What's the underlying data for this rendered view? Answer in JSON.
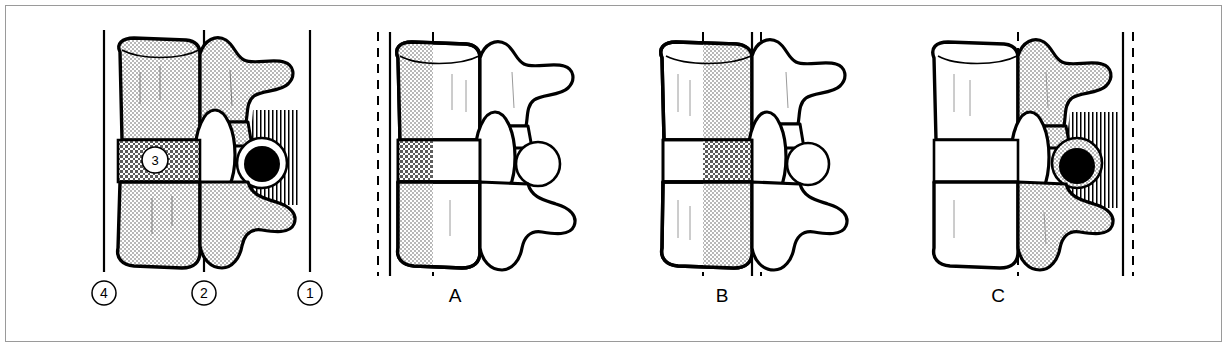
{
  "figure": {
    "panel_count": 4,
    "frame_border_color": "#9a9a9a",
    "background_color": "#ffffff",
    "ink_color": "#000000",
    "stipple_fill_color": "#d2d2d2",
    "crosshatch_fill_color": "#8a8a8a",
    "vertical_hatch_color": "#000000",
    "cord_fill_color": "#000000"
  },
  "panels": [
    {
      "id": "reference",
      "letter": "",
      "letter_x": 0,
      "letter_y": 0,
      "description": "Normal alignment key panel with four numbered reference lines",
      "shading": "whole-vertebra-stippled",
      "cord_visible": true,
      "disc_label": "3",
      "disc_label_x": 155,
      "disc_label_y": 163,
      "lines": [
        {
          "name": "line-4",
          "x": 104,
          "style": "solid",
          "label": "4",
          "label_x": 104,
          "label_y": 297
        },
        {
          "name": "line-2",
          "x": 204,
          "style": "solid",
          "label": "2",
          "label_x": 204,
          "label_y": 297
        },
        {
          "name": "line-1",
          "x": 310,
          "style": "solid",
          "label": "1",
          "label_x": 310,
          "label_y": 297
        }
      ]
    },
    {
      "id": "panel-a",
      "letter": "A",
      "letter_x": 455,
      "letter_y": 300,
      "description": "Anterior vertebral body displacement; body shaded, posterior elements clear",
      "shading": "anterior-body-stippled",
      "cord_visible": false,
      "lines": [
        {
          "name": "line-dashed-anterior",
          "x": 378,
          "style": "dashed"
        },
        {
          "name": "line-solid-anterior",
          "x": 390,
          "style": "solid"
        },
        {
          "name": "line-dashed-mid",
          "x": 433,
          "style": "dashed"
        }
      ]
    },
    {
      "id": "panel-b",
      "letter": "B",
      "letter_x": 722,
      "letter_y": 300,
      "description": "Posterior body margin displacement; posterior half of body shaded",
      "shading": "posterior-body-stippled",
      "cord_visible": false,
      "lines": [
        {
          "name": "line-dashed-anterior",
          "x": 703,
          "style": "dashed"
        },
        {
          "name": "line-solid-posterior",
          "x": 752,
          "style": "solid"
        },
        {
          "name": "line-dashed-posterior",
          "x": 761,
          "style": "dashed"
        }
      ]
    },
    {
      "id": "panel-c",
      "letter": "C",
      "letter_x": 998,
      "letter_y": 300,
      "description": "Posterior element displacement; posterior arch shaded, cord shown black",
      "shading": "posterior-elements-stippled",
      "cord_visible": true,
      "lines": [
        {
          "name": "line-dashed-mid",
          "x": 1018,
          "style": "dashed"
        },
        {
          "name": "line-solid-posterior",
          "x": 1123,
          "style": "solid"
        },
        {
          "name": "line-dashed-posterior",
          "x": 1133,
          "style": "dashed"
        }
      ]
    }
  ],
  "callouts": [
    {
      "number": "1",
      "meaning": "posterior spinous line"
    },
    {
      "number": "2",
      "meaning": "posterior vertebral body line"
    },
    {
      "number": "3",
      "meaning": "intervertebral disc"
    },
    {
      "number": "4",
      "meaning": "anterior vertebral body line"
    }
  ]
}
